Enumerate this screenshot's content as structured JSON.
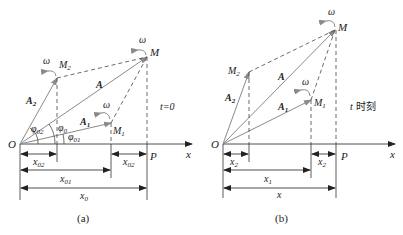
{
  "colors": {
    "vector": "#8a8a8a",
    "line": "#333333",
    "dash": "#444444",
    "text": "#222222"
  },
  "panel_a": {
    "caption": "(a)",
    "time_label": "t=0",
    "labels": {
      "O": "O",
      "M": "M",
      "M1": "M",
      "M1_sub": "1",
      "M2": "M",
      "M2_sub": "2",
      "P": "P",
      "x_axis": "x",
      "A": "A",
      "A1": "A",
      "A1_sub": "1",
      "A2": "A",
      "A2_sub": "2",
      "omega": "ω",
      "phi0": "φ",
      "phi0_sub": "0",
      "phi01": "φ",
      "phi01_sub": "01",
      "phi02": "φ",
      "phi02_sub": "02",
      "x02_left": "x",
      "x02_left_sub": "02",
      "x02_right": "x",
      "x02_right_sub": "02",
      "x01": "x",
      "x01_sub": "01",
      "x0": "x",
      "x0_sub": "0"
    }
  },
  "panel_b": {
    "caption": "(b)",
    "time_label_t": "t",
    "time_label_cjk": "时刻",
    "labels": {
      "O": "O",
      "M": "M",
      "M1": "M",
      "M1_sub": "1",
      "M2": "M",
      "M2_sub": "2",
      "P": "P",
      "x_axis": "x",
      "A": "A",
      "A1": "A",
      "A1_sub": "1",
      "A2": "A",
      "A2_sub": "2",
      "omega": "ω",
      "x2_left": "x",
      "x2_left_sub": "2",
      "x2_right": "x",
      "x2_right_sub": "2",
      "x1": "x",
      "x1_sub": "1",
      "x": "x"
    }
  }
}
